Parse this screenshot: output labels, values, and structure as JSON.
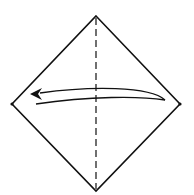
{
  "diagram": {
    "title": "",
    "shape": "square paper rotated as diamond",
    "fold_line": {
      "type": "dashed",
      "orientation": "vertical",
      "position": "center"
    },
    "reference_points": [
      {
        "id": "left-corner-dot",
        "corner": "left"
      },
      {
        "id": "right-corner-dot",
        "corner": "right"
      }
    ],
    "arrow": {
      "type": "curved fold arrow",
      "direction": "right-to-left",
      "meaning": "fold right corner to left corner"
    },
    "colors": {
      "line": "#111111",
      "paper": "#ffffff"
    }
  }
}
